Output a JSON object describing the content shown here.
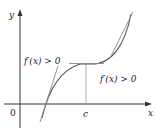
{
  "figure": {
    "axes": {
      "x_label": "x",
      "y_label": "y",
      "origin_label": "0",
      "tick_label": "c"
    },
    "annotations": [
      {
        "text": "f′(x) > 0",
        "position": "left of c"
      },
      {
        "text": "f′(x) > 0",
        "position": "right of c"
      }
    ],
    "colors": {
      "axis": "#333333",
      "curve": "#555555",
      "tangent": "#888888",
      "guide": "#999999"
    }
  }
}
